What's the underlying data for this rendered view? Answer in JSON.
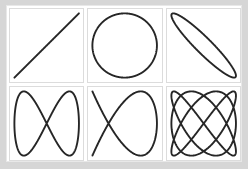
{
  "figure": {
    "background_color": "#d6d6d6",
    "canvas_color": "#ffffff",
    "stroke_color": "#262626",
    "panel_border_color": "#dcdcdc",
    "rows": 2,
    "columns": 3
  },
  "chart_data": {
    "type": "line",
    "subtitle": "",
    "xlabel": "",
    "ylabel": "",
    "grid": false,
    "legend_position": "none",
    "xlim": [
      -1,
      1
    ],
    "ylim": [
      -1,
      1
    ],
    "layout": {
      "rows": 2,
      "columns": 3,
      "order": "row-major"
    },
    "parametric_form": "x = A*sin(a*t + delta), y = B*sin(b*t)",
    "panels": [
      {
        "index": 1,
        "position": "row1-col1",
        "name": "diagonal-line",
        "description": "Straight diagonal line from lower-left to upper-right",
        "freq_x": 1,
        "freq_y": 1,
        "ratio": "1:1",
        "phase_degrees": 0,
        "amplitude_x": 1,
        "amplitude_y": 1,
        "crossings": 0,
        "lobes_top": 0,
        "lobes_side": 0
      },
      {
        "index": 2,
        "position": "row1-col2",
        "name": "circle",
        "description": "Circle",
        "freq_x": 1,
        "freq_y": 1,
        "ratio": "1:1",
        "phase_degrees": 90,
        "amplitude_x": 1,
        "amplitude_y": 1,
        "crossings": 0,
        "lobes_top": 1,
        "lobes_side": 1
      },
      {
        "index": 3,
        "position": "row1-col3",
        "name": "tilted-ellipse",
        "description": "Narrow ellipse tilted along the rising diagonal",
        "freq_x": 1,
        "freq_y": 1,
        "ratio": "1:1",
        "phase_degrees": 160,
        "amplitude_x": 1,
        "amplitude_y": 1,
        "crossings": 0,
        "lobes_top": 1,
        "lobes_side": 1
      },
      {
        "index": 4,
        "position": "row2-col1",
        "name": "figure-eight",
        "description": "Vertical figure-eight / bowtie with a single central crossing",
        "freq_x": 1,
        "freq_y": 2,
        "ratio": "1:2",
        "phase_degrees": 90,
        "amplitude_x": 1,
        "amplitude_y": 1,
        "crossings": 1,
        "lobes_top": 1,
        "lobes_side": 2
      },
      {
        "index": 5,
        "position": "row2-col2",
        "name": "lissajous-2-3",
        "description": "Lissajous figure with two horizontal lobes and three vertical lobes",
        "freq_x": 2,
        "freq_y": 3,
        "ratio": "2:3",
        "phase_degrees": 90,
        "amplitude_x": 1,
        "amplitude_y": 1,
        "crossings": 4,
        "lobes_top": 2,
        "lobes_side": 3
      },
      {
        "index": 6,
        "position": "row2-col3",
        "name": "lissajous-3-4",
        "description": "Dense Lissajous figure with three horizontal lobes and four vertical lobes",
        "freq_x": 3,
        "freq_y": 4,
        "ratio": "3:4",
        "phase_degrees": 90,
        "amplitude_x": 1,
        "amplitude_y": 1,
        "crossings": 9,
        "lobes_top": 3,
        "lobes_side": 4
      }
    ]
  }
}
